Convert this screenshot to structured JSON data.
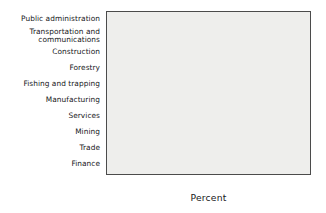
{
  "chart_data": {
    "type": "bar",
    "orientation": "horizontal",
    "title": "",
    "xlabel": "Percent",
    "ylabel": "",
    "xlim": [
      0,
      80
    ],
    "xticks": [
      0,
      20,
      40,
      60,
      80
    ],
    "xtick_labels": [
      "0",
      "20",
      "40",
      "60",
      "80"
    ],
    "grid": false,
    "legend": null,
    "categories": [
      "Public administration",
      "Transportation and\ncommunications",
      "Construction",
      "Forestry",
      "Fishing and trapping",
      "Manufacturing",
      "Services",
      "Mining",
      "Trade",
      "Finance"
    ],
    "values": [
      72,
      53.5,
      48.5,
      45.5,
      44,
      38.5,
      37.5,
      27,
      10,
      2.5
    ],
    "bar_fill_color": "#8d8d8d",
    "bar_edge_color": "#3e3e3e",
    "plot_background_color": "#eeeeec",
    "axis_color": "#4b4b4b",
    "text_color": "#17181a"
  }
}
